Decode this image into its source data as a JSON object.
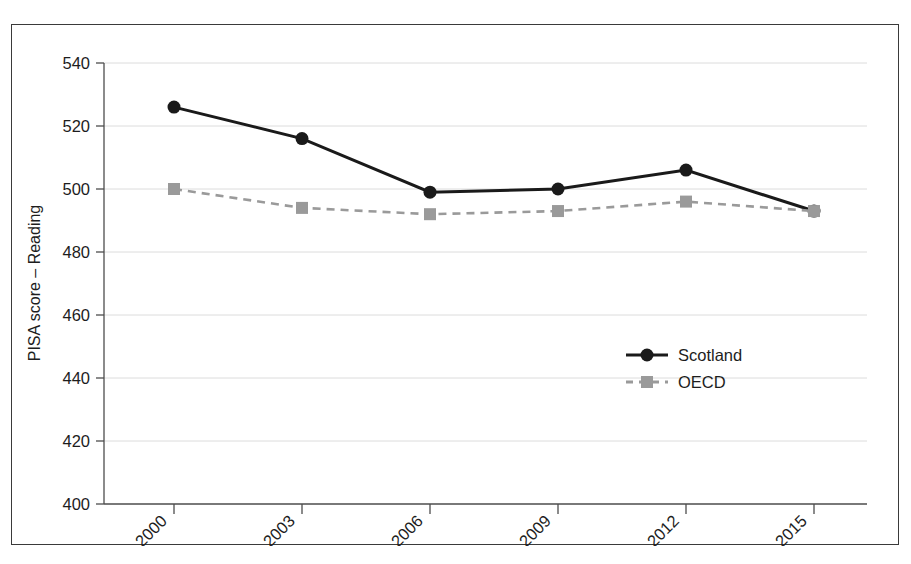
{
  "chart_data": {
    "type": "line",
    "title": "",
    "subtitle": "",
    "xlabel": "",
    "ylabel": "PISA score – Reading",
    "categories": [
      "2000",
      "2003",
      "2006",
      "2009",
      "2012",
      "2015"
    ],
    "x": [
      2000,
      2003,
      2006,
      2009,
      2012,
      2015
    ],
    "ylim": [
      400,
      540
    ],
    "yticks": [
      400,
      420,
      440,
      460,
      480,
      500,
      520,
      540
    ],
    "ytick_labels": [
      "400",
      "420",
      "440",
      "460",
      "480",
      "500",
      "520",
      "540"
    ],
    "xtick_labels": [
      "2000",
      "2003",
      "2006",
      "2009",
      "2012",
      "2015"
    ],
    "xtick_rotation_deg": 45,
    "grid": true,
    "grid_axis": "y",
    "legend_position": "center-right-inside",
    "series": [
      {
        "name": "Scotland",
        "values": [
          526,
          516,
          499,
          500,
          506,
          493
        ],
        "color": "#1a1a1a",
        "line_style": "solid",
        "marker": "circle"
      },
      {
        "name": "OECD",
        "values": [
          500,
          494,
          492,
          493,
          496,
          493
        ],
        "color": "#9a9a9a",
        "line_style": "dashed",
        "marker": "square"
      }
    ]
  },
  "legend": {
    "entries": [
      {
        "label": "Scotland"
      },
      {
        "label": "OECD"
      }
    ]
  },
  "axes": {
    "y_axis_title": "PISA score – Reading",
    "y_ticks": [
      "540",
      "520",
      "500",
      "480",
      "460",
      "440",
      "420",
      "400"
    ],
    "x_ticks": [
      "2000",
      "2003",
      "2006",
      "2009",
      "2012",
      "2015"
    ]
  },
  "colors": {
    "scotland": "#1a1a1a",
    "oecd": "#9a9a9a",
    "grid": "#d8d8d8",
    "axis": "#555555",
    "frame": "#3a3a3a"
  }
}
